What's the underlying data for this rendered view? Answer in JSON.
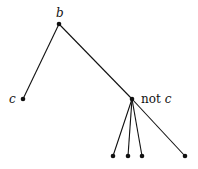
{
  "diagram": {
    "type": "tree",
    "nodes": [
      {
        "id": "b",
        "label": "b",
        "x": 59,
        "y": 24
      },
      {
        "id": "c",
        "label": "c",
        "x": 23,
        "y": 99
      },
      {
        "id": "notc",
        "label_prefix": "not",
        "label_var": "c",
        "x": 132,
        "y": 99
      },
      {
        "id": "leaf1",
        "label": "",
        "x": 113,
        "y": 156
      },
      {
        "id": "leaf2",
        "label": "",
        "x": 128,
        "y": 156
      },
      {
        "id": "leaf3",
        "label": "",
        "x": 142,
        "y": 156
      },
      {
        "id": "leaf4",
        "label": "",
        "x": 185,
        "y": 156
      }
    ],
    "edges": [
      [
        "b",
        "c"
      ],
      [
        "b",
        "notc"
      ],
      [
        "notc",
        "leaf1"
      ],
      [
        "notc",
        "leaf2"
      ],
      [
        "notc",
        "leaf3"
      ],
      [
        "notc",
        "leaf4"
      ]
    ],
    "labels": {
      "root": "b",
      "left": "c",
      "right_prefix": "not",
      "right_var": "c"
    }
  }
}
